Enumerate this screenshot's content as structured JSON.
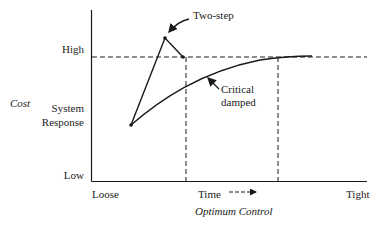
{
  "diagram": {
    "y_axis": {
      "title": "Cost",
      "tick_high": "High",
      "tick_low": "Low",
      "series_label_line1": "System",
      "series_label_line2": "Response"
    },
    "x_axis": {
      "left_label": "Loose",
      "right_label": "Tight",
      "time_label": "Time",
      "subtitle": "Optimum Control"
    },
    "annotations": {
      "two_step": "Two-step",
      "critical_line1": "Critical",
      "critical_line2": "damped"
    },
    "colors": {
      "line": "#1a1a1a",
      "background": "#ffffff"
    }
  }
}
